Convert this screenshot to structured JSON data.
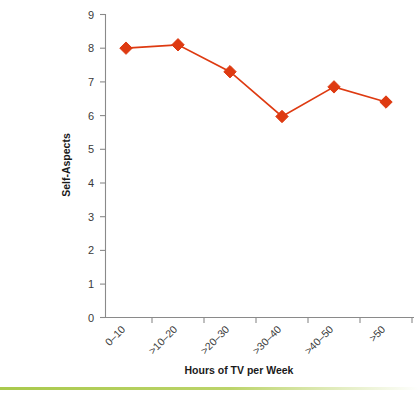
{
  "chart_data": {
    "type": "line",
    "title": "",
    "subtitle": "",
    "xlabel": "Hours of TV per Week",
    "ylabel": "Self-Aspects",
    "categories": [
      "0–10",
      ">10–20",
      ">20–30",
      ">30–40",
      ">40–50",
      ">50"
    ],
    "values": [
      8.0,
      8.1,
      7.3,
      5.97,
      6.85,
      6.4
    ],
    "series": [
      {
        "name": "Self-Aspects",
        "values": [
          8.0,
          8.1,
          7.3,
          5.97,
          6.85,
          6.4
        ]
      }
    ],
    "ylim": [
      0,
      9
    ],
    "ytick_labels": [
      "0",
      "1",
      "2",
      "3",
      "4",
      "5",
      "6",
      "7",
      "8",
      "9"
    ],
    "ytick_values": [
      0,
      1,
      2,
      3,
      4,
      5,
      6,
      7,
      8,
      9
    ],
    "grid": false,
    "legend": false,
    "legend_position": "none",
    "marker": "diamond",
    "series_color": "#DE3A11",
    "axis_color": "#8A8A8A",
    "text_color": "#3A3A3A",
    "background_color": "#FFFFFF",
    "xtick_label_rotation": 45
  },
  "decor": {
    "bottom_rule_color_start": "#A9C94C",
    "bottom_rule_color_mid": "#BCD46A",
    "bottom_rule_color_end": "#FFFFFF",
    "bottom_rule_name": "green-divider"
  }
}
